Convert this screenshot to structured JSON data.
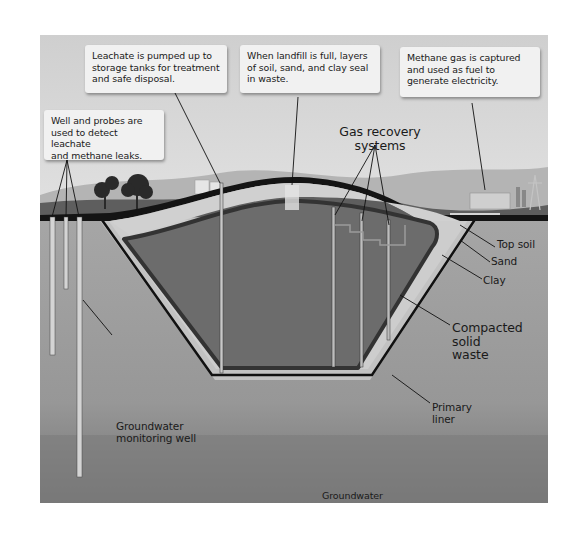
{
  "diagram": {
    "type": "landfill-cross-section",
    "callouts": [
      {
        "id": "leachate",
        "text": "Leachate is pumped up to\nstorage tanks for treatment\nand safe disposal."
      },
      {
        "id": "seal",
        "text": "When landfill is full, layers\nof soil, sand, and clay seal\nin waste."
      },
      {
        "id": "methane",
        "text": "Methane gas is captured\nand used as fuel to\ngenerate electricity."
      },
      {
        "id": "probes",
        "text": "Well and probes are\nused to detect leachate\nand methane leaks."
      }
    ],
    "labels": {
      "gas_recovery": "Gas recovery\nsystems",
      "top_soil": "Top soil",
      "sand": "Sand",
      "clay": "Clay",
      "compacted_waste": "Compacted\nsolid\nwaste",
      "primary_liner": "Primary\nliner",
      "groundwater_well": "Groundwater\nmonitoring well",
      "groundwater": "Groundwater"
    },
    "colors": {
      "sky": "#d6d6d6",
      "hills": "#a9a9a9",
      "grass": "#5c5c5c",
      "soil_band": "#1c1c1c",
      "sand": "#c8c8c8",
      "waste": "#6e6e6e",
      "ground": "#9a9a9a",
      "groundwater": "#7a7a7a"
    }
  }
}
